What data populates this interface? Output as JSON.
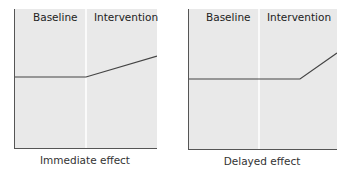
{
  "panels": [
    {
      "phase_labels": [
        "Baseline",
        "Intervention"
      ],
      "caption": "Immediate effect",
      "line_points": [
        [
          0,
          68
        ],
        [
          71,
          68
        ],
        [
          142,
          47
        ]
      ]
    },
    {
      "phase_labels": [
        "Baseline",
        "Intervention"
      ],
      "caption": "Delayed effect",
      "line_points": [
        [
          0,
          70
        ],
        [
          111,
          70
        ],
        [
          148,
          44
        ]
      ]
    }
  ],
  "colors": {
    "panel_bg": "#e9e9e9",
    "axis": "#555555",
    "line": "#444444",
    "divider": "#ffffff"
  }
}
